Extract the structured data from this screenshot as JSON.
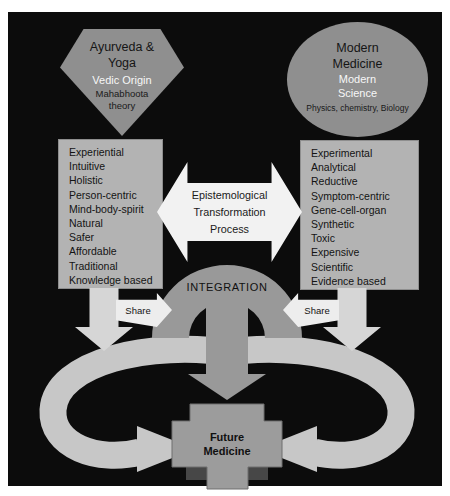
{
  "sources": {
    "ayurveda": {
      "title": "Ayurveda & Yoga",
      "origin": "Vedic Origin",
      "theory": "Mahabhoota theory"
    },
    "modern": {
      "title": "Modern Medicine",
      "origin": "Modern Science",
      "theory": "Physics, chemistry, Biology"
    }
  },
  "attributes": {
    "ayurveda": [
      "Experiential",
      "Intuitive",
      "Holistic",
      "Person-centric",
      "Mind-body-spirit",
      "Natural",
      "Safer",
      "Affordable",
      "Traditional",
      "Knowledge based"
    ],
    "modern": [
      "Experimental",
      "Analytical",
      "Reductive",
      "Symptom-centric",
      "Gene-cell-organ",
      "Synthetic",
      "Toxic",
      "Expensive",
      "Scientific",
      "Evidence based"
    ]
  },
  "process": {
    "label": "Epistemological Transformation Process"
  },
  "integration": {
    "label": "INTEGRATION",
    "share_left": "Share",
    "share_right": "Share"
  },
  "outcome": {
    "label": "Future Medicine"
  },
  "colors": {
    "background": "#0c0c0c",
    "shape_gray": "#8f8f8f",
    "box_gray": "#b3b3b3",
    "arch_gray": "#999999",
    "arrow_white": "#f2f2f2",
    "loop_gray": "#c7c7c7",
    "down_arrow_gray": "#d6d6d6",
    "dark_bar": "#474747"
  }
}
